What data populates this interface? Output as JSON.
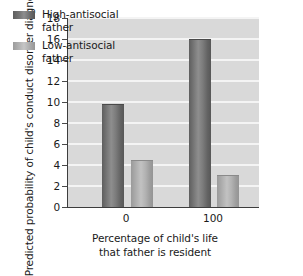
{
  "chart_data": {
    "type": "bar",
    "title": "",
    "xlabel": "Percentage of child's life\nthat father is resident",
    "ylabel": "Predicted probability of child's\nconduct disorder diagnosis",
    "categories": [
      "0",
      "100"
    ],
    "series": [
      {
        "name": "High-antisocial\nfather",
        "values": [
          9.7,
          15.9
        ],
        "color": "#6e6e6e"
      },
      {
        "name": "Low-antisocial\nfather",
        "values": [
          4.4,
          2.95
        ],
        "color": "#b4b4b4"
      }
    ],
    "ylim": [
      0,
      18
    ],
    "yticks": [
      "0",
      "2",
      "4",
      "6",
      "8",
      "10",
      "12",
      "14",
      "16",
      "18"
    ],
    "grid": true,
    "legend_position": "top-left",
    "plot_background": "#d9d9d9",
    "gridline_color": "#f4f4f4",
    "axis_color": "#3d3d3d"
  }
}
